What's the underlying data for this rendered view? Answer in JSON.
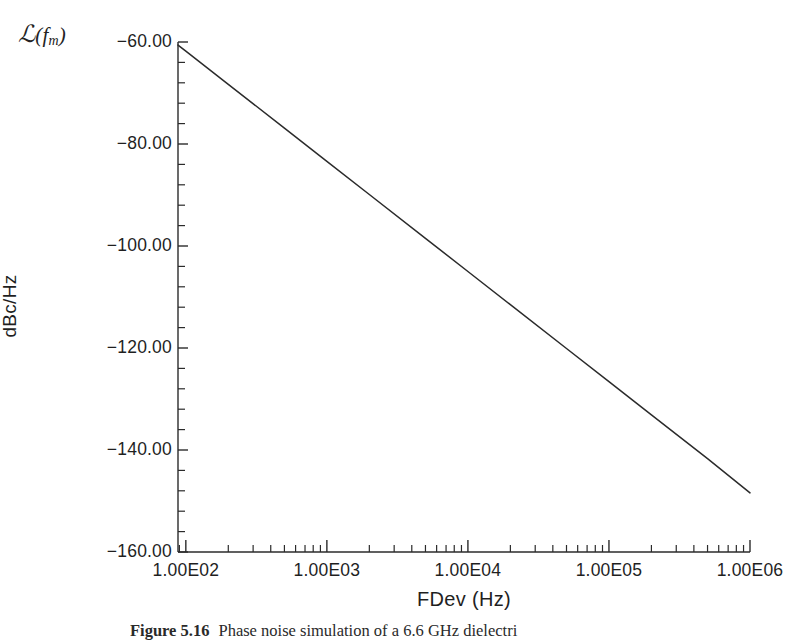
{
  "figure": {
    "noise_symbol": {
      "script": "ℒ",
      "open_paren": "(",
      "variable": "f",
      "subscript": "m",
      "close_paren": ")"
    },
    "caption_label": "Figure 5.16",
    "caption_text": "Phase noise simulation of a 6.6 GHz dielectri"
  },
  "chart_data": {
    "type": "line",
    "title": "",
    "xlabel": "FDev (Hz)",
    "ylabel": "dBc/Hz",
    "xscale": "log",
    "yscale": "linear",
    "xlim": [
      88,
      1000000
    ],
    "ylim": [
      -160,
      -60
    ],
    "grid": false,
    "legend": false,
    "xticks": [
      100,
      1000,
      10000,
      100000,
      1000000
    ],
    "xtick_labels": [
      "1.00E02",
      "1.00E03",
      "1.00E04",
      "1.00E05",
      "1.00E06"
    ],
    "yticks": [
      -60,
      -80,
      -100,
      -120,
      -140,
      -160
    ],
    "ytick_labels": [
      "-60.00",
      "-80.00",
      "-100.00",
      "-120.00",
      "-140.00",
      "-160.00"
    ],
    "y_minor_ticks_per_interval": 4,
    "series": [
      {
        "name": "Phase noise",
        "color": "#2b2b2b",
        "slope_db_per_decade": -21.6,
        "x": [
          88,
          100,
          200,
          500,
          1000,
          2000,
          5000,
          10000,
          20000,
          50000,
          100000,
          200000,
          500000,
          1000000
        ],
        "y": [
          -60.6,
          -61.8,
          -68.3,
          -76.9,
          -83.4,
          -89.9,
          -98.5,
          -105.0,
          -111.5,
          -120.1,
          -126.6,
          -133.1,
          -141.7,
          -148.4
        ]
      }
    ]
  }
}
